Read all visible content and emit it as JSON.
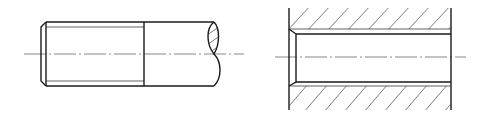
{
  "figure": {
    "title": "",
    "views": [
      {
        "name": "external-thread-view",
        "description": "Threaded rod (external thread) shown with break line"
      },
      {
        "name": "internal-thread-view",
        "description": "Sectioned tapped hole (internal thread) with hatching"
      }
    ],
    "colors": {
      "line": "#1a1a1a",
      "background": "#ffffff"
    }
  }
}
